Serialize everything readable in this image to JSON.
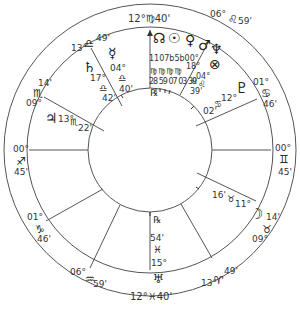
{
  "chart": {
    "type": "natal-wheel",
    "center": [
      150,
      150
    ],
    "radii": {
      "outer": 146,
      "sign_band_inner": 123,
      "inner": 62
    },
    "line_color": "#555555"
  },
  "cusps": [
    {
      "house": "MC",
      "deg": "12°",
      "sign": "♍",
      "min": "40'",
      "label": "12°♍40'"
    },
    {
      "house": "11",
      "deg": "06°",
      "sign": "♌",
      "min": "59'"
    },
    {
      "house": "12",
      "deg": "01°",
      "sign": "♋",
      "min": "46'"
    },
    {
      "house": "ASC",
      "deg": "00°",
      "sign": "♊",
      "min": "45'"
    },
    {
      "house": "2",
      "deg": "09°",
      "sign": "♉",
      "min": "14'"
    },
    {
      "house": "3",
      "deg": "13°",
      "sign": "♈",
      "min": "49'"
    },
    {
      "house": "IC",
      "deg": "12°",
      "sign": "♓",
      "min": "40'",
      "label": "12°♓40'"
    },
    {
      "house": "5",
      "deg": "06°",
      "sign": "♒",
      "min": "59'"
    },
    {
      "house": "6",
      "deg": "01°",
      "sign": "♑",
      "min": "46'"
    },
    {
      "house": "DSC",
      "deg": "00°",
      "sign": "♐",
      "min": "45'"
    },
    {
      "house": "8",
      "deg": "09°",
      "sign": "♏",
      "min": "14'"
    },
    {
      "house": "9",
      "deg": "13°",
      "sign": "♎",
      "min": "49'"
    }
  ],
  "planets": [
    {
      "name": "North Node",
      "glyph": "☊",
      "deg": "11",
      "sign": "♍",
      "min": "28"
    },
    {
      "name": "Sun",
      "glyph": "☉",
      "deg": "07",
      "sign": "♍",
      "min": "59"
    },
    {
      "name": "Venus",
      "glyph": "♀",
      "deg": "05",
      "sign": "♍",
      "min": "07"
    },
    {
      "name": "Mars",
      "glyph": "♂",
      "deg": "05",
      "sign": "♍",
      "min": "03"
    },
    {
      "name": "Neptune",
      "glyph": "♆",
      "deg": "00°",
      "sign": "♌",
      "min": "39'"
    },
    {
      "name": "Part of Fortune",
      "glyph": "⊗",
      "deg": "18°",
      "sign": "♌",
      "min": "04°"
    },
    {
      "name": "Pluto",
      "glyph": "♇",
      "deg": "12°",
      "sign": "♋",
      "min": "02'"
    },
    {
      "name": "Moon",
      "glyph": "☽",
      "deg": "11°",
      "sign": "♉",
      "min": "16'"
    },
    {
      "name": "Uranus",
      "glyph": "♅",
      "deg": "15°",
      "sign": "♓",
      "min": "54'",
      "retro": "℞"
    },
    {
      "name": "Jupiter",
      "glyph": "♃",
      "deg": "13°",
      "sign": "♏",
      "min": "22'"
    },
    {
      "name": "Saturn",
      "glyph": "♄",
      "deg": "17°",
      "sign": "♎",
      "min": "42'"
    },
    {
      "name": "Mercury",
      "glyph": "☿",
      "deg": "04°",
      "sign": "♎",
      "min": "40'"
    }
  ],
  "extra": {
    "retro_top": "℞",
    "cluster_degs": "1107b5b00°",
    "cluster_signs": "♍♍♍♍",
    "cluster_mins": "28 59 07 03 39"
  }
}
